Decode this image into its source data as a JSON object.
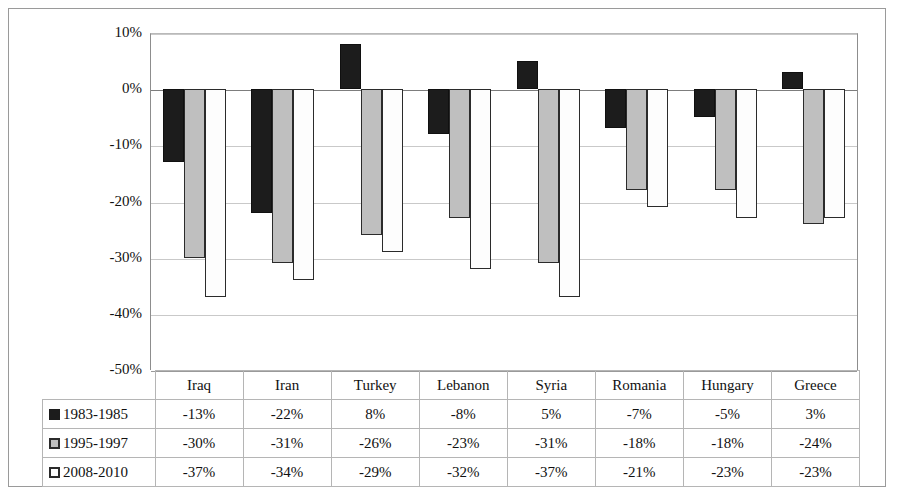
{
  "chart_data": {
    "type": "bar",
    "title": "",
    "xlabel": "",
    "ylabel": "",
    "ylim": [
      -50,
      10
    ],
    "ytick_step": 10,
    "grid": true,
    "legend_position": "table-left",
    "value_suffix": "%",
    "categories": [
      "Iraq",
      "Iran",
      "Turkey",
      "Lebanon",
      "Syria",
      "Romania",
      "Hungary",
      "Greece"
    ],
    "ytick_labels": [
      "10%",
      "0%",
      "-10%",
      "-20%",
      "-30%",
      "-40%",
      "-50%"
    ],
    "ytick_values": [
      10,
      0,
      -10,
      -20,
      -30,
      -40,
      -50
    ],
    "series": [
      {
        "name": "1983-1985",
        "swatch": "black-square-icon",
        "color": "#1c1c1c",
        "values": [
          -13,
          -22,
          8,
          -8,
          5,
          -7,
          -5,
          3
        ],
        "labels": [
          "-13%",
          "-22%",
          "8%",
          "-8%",
          "5%",
          "-7%",
          "-5%",
          "3%"
        ]
      },
      {
        "name": "1995-1997",
        "swatch": "gray-square-icon",
        "color": "#bfbfbf",
        "values": [
          -30,
          -31,
          -26,
          -23,
          -31,
          -18,
          -18,
          -24
        ],
        "labels": [
          "-30%",
          "-31%",
          "-26%",
          "-23%",
          "-31%",
          "-18%",
          "-18%",
          "-24%"
        ]
      },
      {
        "name": "2008-2010",
        "swatch": "white-square-icon",
        "color": "#fdfdfd",
        "values": [
          -37,
          -34,
          -29,
          -32,
          -37,
          -21,
          -23,
          -23
        ],
        "labels": [
          "-37%",
          "-34%",
          "-29%",
          "-32%",
          "-37%",
          "-21%",
          "-23%",
          "-23%"
        ]
      }
    ]
  }
}
